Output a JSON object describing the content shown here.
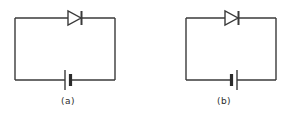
{
  "figure": {
    "background_color": "#ffffff",
    "line_color": "#3a3a3a",
    "line_width": 1.4,
    "panels": [
      {
        "id": "a",
        "caption": "(a)",
        "loop": {
          "x": 15,
          "y": 18,
          "width": 100,
          "height": 62
        },
        "diode": {
          "name": "diode",
          "position": "top-wire",
          "center_x": 75,
          "center_y": 18,
          "direction": "right",
          "anode_side": "left",
          "cathode_side": "right",
          "triangle_width": 14,
          "triangle_height": 14,
          "bar_height": 14
        },
        "battery": {
          "name": "battery-cell",
          "position": "bottom-wire",
          "center_x": 68,
          "center_y": 80,
          "long_plate_side": "left",
          "long_plate_height": 20,
          "short_plate_side": "right",
          "short_plate_height": 12,
          "plate_gap": 5
        }
      },
      {
        "id": "b",
        "caption": "(b)",
        "loop": {
          "x": 186,
          "y": 18,
          "width": 90,
          "height": 62
        },
        "diode": {
          "name": "diode",
          "position": "top-wire",
          "center_x": 232,
          "center_y": 18,
          "direction": "right",
          "anode_side": "left",
          "cathode_side": "right",
          "triangle_width": 14,
          "triangle_height": 14,
          "bar_height": 14
        },
        "battery": {
          "name": "battery-cell",
          "position": "bottom-wire",
          "center_x": 233,
          "center_y": 80,
          "long_plate_side": "right",
          "long_plate_height": 20,
          "short_plate_side": "left",
          "short_plate_height": 12,
          "plate_gap": 5
        }
      }
    ]
  },
  "captions": {
    "a": "(a)",
    "b": "(b)"
  }
}
